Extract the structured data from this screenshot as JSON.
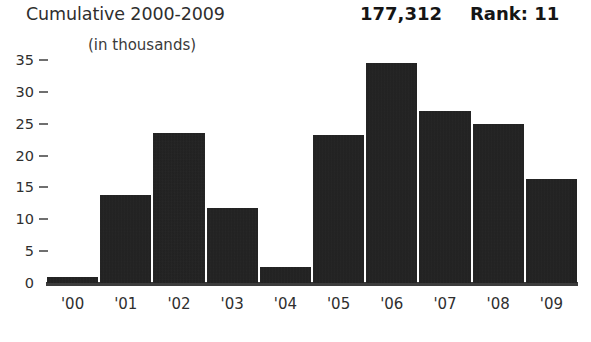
{
  "header": {
    "title": "Cumulative 2000-2009",
    "subtitle": "(in thousands)",
    "total_value": "177,312",
    "rank_label": "Rank: 11"
  },
  "axes": {
    "y_ticks": [
      "35",
      "30",
      "25",
      "20",
      "15",
      "10",
      "5",
      "0"
    ],
    "x_labels": [
      "'00",
      "'01",
      "'02",
      "'03",
      "'04",
      "'05",
      "'06",
      "'07",
      "'08",
      "'09"
    ]
  },
  "colors": {
    "bar": "#1c1c1c",
    "axis": "#3c3c3c",
    "tick": "#6f6f6f",
    "text": "#2f2f2f",
    "background": "#ffffff"
  },
  "chart_data": {
    "type": "bar",
    "title": "Cumulative 2000-2009",
    "subtitle": "(in thousands)",
    "xlabel": "",
    "ylabel": "",
    "ylim": [
      0,
      35
    ],
    "ytick_step": 5,
    "grid": false,
    "legend": "none",
    "categories": [
      "'00",
      "'01",
      "'02",
      "'03",
      "'04",
      "'05",
      "'06",
      "'07",
      "'08",
      "'09"
    ],
    "values": [
      1.0,
      13.8,
      23.5,
      11.7,
      2.5,
      23.2,
      34.5,
      27.0,
      25.0,
      16.3
    ],
    "annotations": {
      "cumulative_total": "177,312",
      "rank": "Rank: 11"
    }
  }
}
